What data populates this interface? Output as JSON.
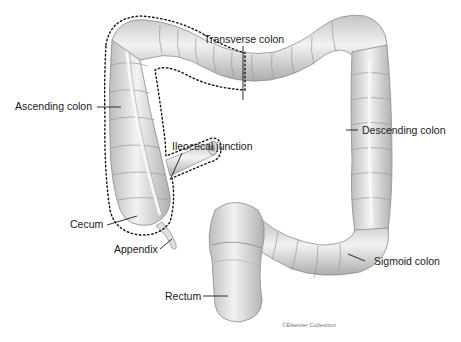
{
  "figure": {
    "labels": {
      "transverse_colon": "Transverse colon",
      "ascending_colon": "Ascending colon",
      "descending_colon": "Descending colon",
      "ileocecal_junction": "Ileocecal junction",
      "cecum": "Cecum",
      "appendix": "Appendix",
      "sigmoid_colon": "Sigmoid colon",
      "rectum": "Rectum"
    },
    "copyright": "©Elsevier Collection",
    "colors": {
      "tissue_fill": "#e6e6e6",
      "tissue_shadow": "#b5b5b5",
      "outline": "#8a8a8a",
      "dotted_region": "#111111",
      "label_text": "#1a1a1a",
      "background": "#ffffff"
    }
  }
}
